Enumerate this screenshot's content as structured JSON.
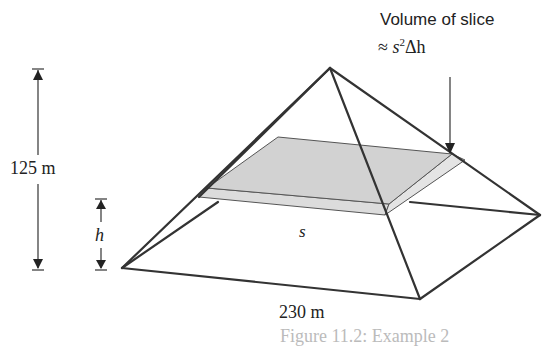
{
  "figure": {
    "callout_line1": "Volume of slice",
    "callout_line2_prefix": "≈ ",
    "callout_line2_s": "s",
    "callout_line2_exp": "2",
    "callout_line2_rest": "Δh",
    "height_label": "125 m",
    "h_label": "h",
    "s_label": "s",
    "base_label": "230 m",
    "caption": "Figure 11.2: Example 2"
  },
  "colors": {
    "line": "#333333",
    "slice_fill": "#d4d4d4",
    "slice_side": "#e2e2e2"
  }
}
